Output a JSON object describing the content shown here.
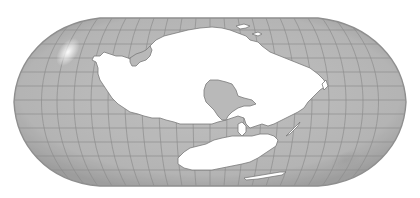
{
  "map": {
    "projection": "robinson-like",
    "width": 420,
    "height": 198,
    "colors": {
      "background": "#ffffff",
      "ocean": "#b9b9b9",
      "ocean_dark": "#8e8e8e",
      "graticule": "#8c8c8c",
      "land": "#ffffff",
      "coast": "#7a7a7a",
      "highlight": "#f2f2f2"
    },
    "outline": {
      "top_y": 18,
      "bottom_y": 186,
      "left_x": 14,
      "right_x": 406,
      "flat_top_from_x": 100,
      "flat_top_to_x": 318
    },
    "graticule": {
      "parallels_y": [
        18,
        30,
        44,
        58,
        72,
        86,
        100,
        114,
        128,
        142,
        156,
        170,
        186
      ],
      "meridian_count": 24
    },
    "landmasses": [
      {
        "id": "main-continent",
        "label": ""
      },
      {
        "id": "southern-continent",
        "label": ""
      },
      {
        "id": "inner-sea",
        "label": ""
      },
      {
        "id": "island-chain",
        "label": ""
      },
      {
        "id": "long-island",
        "label": ""
      }
    ]
  }
}
